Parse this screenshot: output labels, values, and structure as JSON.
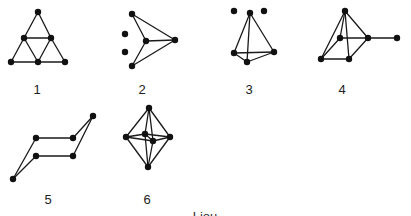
{
  "figure": {
    "background": "#ffffff",
    "ink_color": "#111111",
    "caption": "Liou",
    "graphs": [
      {
        "id": 1,
        "label": "1",
        "label_pos": [
          37,
          89
        ],
        "nodes": [
          [
            38,
            12
          ],
          [
            24,
            38
          ],
          [
            51,
            38
          ],
          [
            11,
            62
          ],
          [
            38,
            62
          ],
          [
            65,
            62
          ]
        ],
        "edges": [
          [
            0,
            1
          ],
          [
            0,
            2
          ],
          [
            1,
            2
          ],
          [
            1,
            3
          ],
          [
            1,
            4
          ],
          [
            2,
            4
          ],
          [
            2,
            5
          ],
          [
            3,
            4
          ],
          [
            4,
            5
          ]
        ]
      },
      {
        "id": 2,
        "label": "2",
        "label_pos": [
          142,
          89
        ],
        "nodes": [
          [
            132,
            14
          ],
          [
            146,
            41
          ],
          [
            175,
            40
          ],
          [
            132,
            66
          ],
          [
            125,
            34
          ],
          [
            125,
            52
          ]
        ],
        "edges": [
          [
            0,
            1
          ],
          [
            0,
            2
          ],
          [
            1,
            2
          ],
          [
            1,
            3
          ],
          [
            2,
            3
          ]
        ]
      },
      {
        "id": 3,
        "label": "3",
        "label_pos": [
          249,
          89
        ],
        "nodes": [
          [
            250,
            13
          ],
          [
            234,
            53
          ],
          [
            247,
            62
          ],
          [
            274,
            52
          ],
          [
            234,
            11
          ],
          [
            264,
            11
          ]
        ],
        "edges": [
          [
            0,
            1
          ],
          [
            0,
            2
          ],
          [
            0,
            3
          ],
          [
            1,
            2
          ],
          [
            1,
            3
          ],
          [
            2,
            3
          ]
        ]
      },
      {
        "id": 4,
        "label": "4",
        "label_pos": [
          342,
          89
        ],
        "nodes": [
          [
            345,
            11
          ],
          [
            340,
            38
          ],
          [
            368,
            38
          ],
          [
            321,
            59
          ],
          [
            349,
            59
          ],
          [
            397,
            38
          ]
        ],
        "edges": [
          [
            0,
            1
          ],
          [
            0,
            2
          ],
          [
            0,
            3
          ],
          [
            0,
            4
          ],
          [
            1,
            2
          ],
          [
            1,
            3
          ],
          [
            2,
            4
          ],
          [
            3,
            4
          ],
          [
            2,
            5
          ]
        ]
      },
      {
        "id": 5,
        "label": "5",
        "label_pos": [
          48,
          199
        ],
        "nodes": [
          [
            93,
            116
          ],
          [
            36,
            138
          ],
          [
            73,
            138
          ],
          [
            36,
            156
          ],
          [
            73,
            156
          ],
          [
            13,
            179
          ]
        ],
        "edges": [
          [
            0,
            2
          ],
          [
            0,
            4
          ],
          [
            1,
            2
          ],
          [
            3,
            4
          ],
          [
            1,
            5
          ],
          [
            3,
            5
          ]
        ]
      },
      {
        "id": 6,
        "label": "6",
        "label_pos": [
          147,
          199
        ],
        "nodes": [
          [
            149,
            108
          ],
          [
            126,
            137
          ],
          [
            170,
            137
          ],
          [
            145,
            134
          ],
          [
            153,
            141
          ],
          [
            148,
            167
          ]
        ],
        "edges": [
          [
            0,
            1
          ],
          [
            0,
            2
          ],
          [
            0,
            3
          ],
          [
            0,
            4
          ],
          [
            5,
            1
          ],
          [
            5,
            2
          ],
          [
            5,
            3
          ],
          [
            5,
            4
          ],
          [
            1,
            3
          ],
          [
            3,
            2
          ],
          [
            1,
            4
          ],
          [
            4,
            2
          ],
          [
            3,
            4
          ]
        ]
      }
    ]
  }
}
